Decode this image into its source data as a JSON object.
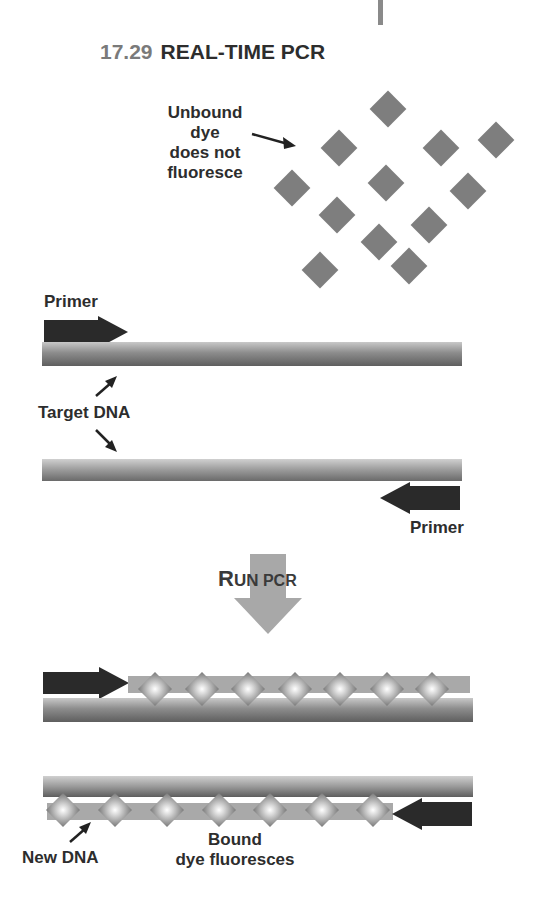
{
  "figure": {
    "number": "17.29",
    "title": "REAL-TIME PCR"
  },
  "labels": {
    "unbound_dye": [
      "Unbound",
      "dye",
      "does not",
      "fluoresce"
    ],
    "primer_top": "Primer",
    "target_dna": "Target DNA",
    "primer_bottom": "Primer",
    "run_pcr_initial": "R",
    "run_pcr_rest_large": "UN",
    "run_pcr_rest_small": " PCR",
    "new_dna": "New DNA",
    "bound_dye": [
      "Bound",
      "dye fluoresces"
    ]
  },
  "colors": {
    "unbound_dye": "#7e7e7e",
    "primer": "#2a2a2a",
    "run_arrow": "#a8a8a8",
    "new_dna": "#a9a9a9",
    "title_number": "#7a7a7a"
  },
  "unbound_dye_positions": [
    [
      388,
      109
    ],
    [
      339,
      148
    ],
    [
      441,
      148
    ],
    [
      496,
      140
    ],
    [
      292,
      188
    ],
    [
      386,
      183
    ],
    [
      468,
      191
    ],
    [
      337,
      215
    ],
    [
      429,
      225
    ],
    [
      379,
      242
    ],
    [
      320,
      270
    ],
    [
      409,
      266
    ]
  ],
  "bound_dye_row1_x": [
    155,
    202,
    248,
    295,
    340,
    387,
    432
  ],
  "bound_dye_row2_x": [
    63,
    115,
    167,
    219,
    270,
    322,
    373
  ]
}
